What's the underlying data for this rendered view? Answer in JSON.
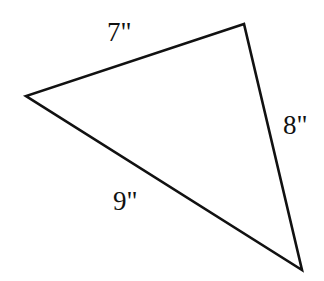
{
  "figure": {
    "kind": "triangle-diagram",
    "canvas": {
      "width": 324,
      "height": 281
    },
    "background_color": "#ffffff",
    "stroke_color": "#111111",
    "stroke_width": 2.6,
    "vertices": [
      {
        "name": "apex-top",
        "x": 244,
        "y": 24
      },
      {
        "name": "vertex-left",
        "x": 26,
        "y": 96
      },
      {
        "name": "vertex-bottom-right",
        "x": 302,
        "y": 270
      }
    ],
    "polygon_points": "244,24 26,96 302,270",
    "sides": [
      {
        "id": "side-a",
        "label": "7\"",
        "value": 7,
        "unit": "inches",
        "between": [
          "vertex-left",
          "apex-top"
        ],
        "label_x": 107,
        "label_y": 19
      },
      {
        "id": "side-b",
        "label": "8\"",
        "value": 8,
        "unit": "inches",
        "between": [
          "apex-top",
          "vertex-bottom-right"
        ],
        "label_x": 283,
        "label_y": 112
      },
      {
        "id": "side-c",
        "label": "9\"",
        "value": 9,
        "unit": "inches",
        "between": [
          "vertex-left",
          "vertex-bottom-right"
        ],
        "label_x": 113,
        "label_y": 188
      }
    ]
  }
}
